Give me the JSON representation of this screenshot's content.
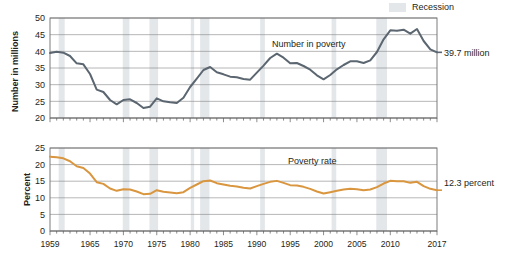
{
  "legend": {
    "recession_label": "Recession",
    "recession_color": "#e3e7ea"
  },
  "annotations": {
    "top_end_value": "39.7 million",
    "bottom_end_value": "12.3 percent",
    "top_series_label": "Number in poverty",
    "bottom_series_label": "Poverty rate"
  },
  "axis_labels": {
    "top_y": "Number in millions",
    "bottom_y": "Percent"
  },
  "chart_data": [
    {
      "type": "line",
      "title": "",
      "xlabel": "",
      "ylabel": "Number in millions",
      "ylim": [
        20,
        50
      ],
      "yticks": [
        20,
        25,
        30,
        35,
        40,
        45,
        50
      ],
      "xlim": [
        1959,
        2017
      ],
      "xticks": [
        1959,
        1965,
        1970,
        1975,
        1980,
        1985,
        1990,
        1995,
        2000,
        2005,
        2010,
        2017
      ],
      "grid": true,
      "legend_position": "top-right",
      "line_color": "#5b6670",
      "series": [
        {
          "name": "Number in poverty",
          "x": [
            1959,
            1960,
            1961,
            1962,
            1963,
            1964,
            1965,
            1966,
            1967,
            1968,
            1969,
            1970,
            1971,
            1972,
            1973,
            1974,
            1975,
            1976,
            1977,
            1978,
            1979,
            1980,
            1981,
            1982,
            1983,
            1984,
            1985,
            1986,
            1987,
            1988,
            1989,
            1990,
            1991,
            1992,
            1993,
            1994,
            1995,
            1996,
            1997,
            1998,
            1999,
            2000,
            2001,
            2002,
            2003,
            2004,
            2005,
            2006,
            2007,
            2008,
            2009,
            2010,
            2011,
            2012,
            2013,
            2014,
            2015,
            2016,
            2017
          ],
          "values": [
            39.5,
            39.9,
            39.6,
            38.6,
            36.4,
            36.1,
            33.2,
            28.5,
            27.8,
            25.4,
            24.1,
            25.4,
            25.6,
            24.5,
            23.0,
            23.4,
            25.9,
            25.0,
            24.7,
            24.5,
            26.1,
            29.3,
            31.8,
            34.4,
            35.3,
            33.7,
            33.1,
            32.4,
            32.2,
            31.7,
            31.5,
            33.6,
            35.7,
            38.0,
            39.3,
            38.1,
            36.4,
            36.5,
            35.6,
            34.5,
            32.8,
            31.6,
            32.9,
            34.6,
            35.9,
            37.0,
            37.0,
            36.5,
            37.3,
            39.8,
            43.6,
            46.3,
            46.2,
            46.5,
            45.3,
            46.7,
            43.1,
            40.6,
            39.7
          ],
          "end_label": "39.7 million"
        }
      ],
      "recession_bands": [
        [
          1960.3,
          1961.2
        ],
        [
          1969.9,
          1970.9
        ],
        [
          1973.9,
          1975.2
        ],
        [
          1980.1,
          1980.6
        ],
        [
          1981.5,
          1982.9
        ],
        [
          1990.5,
          1991.2
        ],
        [
          2001.2,
          2001.9
        ],
        [
          2007.9,
          2009.5
        ]
      ]
    },
    {
      "type": "line",
      "title": "",
      "xlabel": "",
      "ylabel": "Percent",
      "ylim": [
        0,
        25
      ],
      "yticks": [
        0,
        5,
        10,
        15,
        20,
        25
      ],
      "xlim": [
        1959,
        2017
      ],
      "xticks": [
        1959,
        1965,
        1970,
        1975,
        1980,
        1985,
        1990,
        1995,
        2000,
        2005,
        2010,
        2017
      ],
      "grid": true,
      "line_color": "#d9963f",
      "series": [
        {
          "name": "Poverty rate",
          "x": [
            1959,
            1960,
            1961,
            1962,
            1963,
            1964,
            1965,
            1966,
            1967,
            1968,
            1969,
            1970,
            1971,
            1972,
            1973,
            1974,
            1975,
            1976,
            1977,
            1978,
            1979,
            1980,
            1981,
            1982,
            1983,
            1984,
            1985,
            1986,
            1987,
            1988,
            1989,
            1990,
            1991,
            1992,
            1993,
            1994,
            1995,
            1996,
            1997,
            1998,
            1999,
            2000,
            2001,
            2002,
            2003,
            2004,
            2005,
            2006,
            2007,
            2008,
            2009,
            2010,
            2011,
            2012,
            2013,
            2014,
            2015,
            2016,
            2017
          ],
          "values": [
            22.4,
            22.2,
            21.9,
            21.0,
            19.5,
            19.0,
            17.3,
            14.7,
            14.2,
            12.8,
            12.1,
            12.6,
            12.5,
            11.9,
            11.1,
            11.2,
            12.3,
            11.8,
            11.6,
            11.4,
            11.7,
            13.0,
            14.0,
            15.0,
            15.2,
            14.4,
            14.0,
            13.6,
            13.4,
            13.0,
            12.8,
            13.5,
            14.2,
            14.8,
            15.1,
            14.5,
            13.8,
            13.7,
            13.3,
            12.7,
            11.9,
            11.3,
            11.7,
            12.1,
            12.5,
            12.7,
            12.6,
            12.3,
            12.5,
            13.2,
            14.3,
            15.1,
            15.0,
            15.0,
            14.5,
            14.8,
            13.5,
            12.7,
            12.3
          ],
          "end_label": "12.3 percent"
        }
      ],
      "recession_bands": [
        [
          1960.3,
          1961.2
        ],
        [
          1969.9,
          1970.9
        ],
        [
          1973.9,
          1975.2
        ],
        [
          1980.1,
          1980.6
        ],
        [
          1981.5,
          1982.9
        ],
        [
          1990.5,
          1991.2
        ],
        [
          2001.2,
          2001.9
        ],
        [
          2007.9,
          2009.5
        ]
      ]
    }
  ]
}
